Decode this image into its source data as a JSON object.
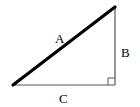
{
  "diagram": {
    "type": "right-triangle",
    "labels": {
      "hypotenuse": "A",
      "vertical_side": "B",
      "horizontal_side": "C"
    },
    "right_angle_marker": true,
    "colors": {
      "stroke": "#000000",
      "background": "#ffffff"
    }
  }
}
